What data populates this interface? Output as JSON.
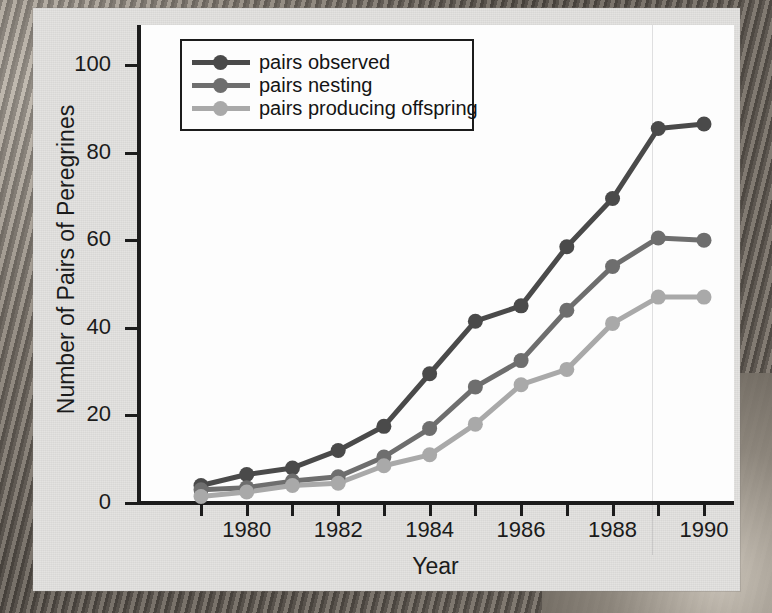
{
  "figure": {
    "background_color": "#e4e3e1",
    "plot_background_color": "#fdfdfd",
    "axis_color": "#1c1c1c"
  },
  "legend": {
    "position": "top-left-inside",
    "entries": [
      {
        "label": "pairs observed",
        "color": "#4a4a4a"
      },
      {
        "label": "pairs nesting",
        "color": "#6e6e6e"
      },
      {
        "label": "pairs producing offspring",
        "color": "#a9a9a9"
      }
    ]
  },
  "axes": {
    "y_title": "Number of Pairs of Peregrines",
    "x_title": "Year",
    "y_ticks": [
      "0",
      "20",
      "40",
      "60",
      "80",
      "100"
    ],
    "x_ticks_labeled": [
      "1980",
      "1982",
      "1984",
      "1986",
      "1988",
      "1990"
    ]
  },
  "chart_data": {
    "type": "line",
    "title": "",
    "subtitle": "",
    "xlabel": "Year",
    "ylabel": "Number of Pairs of Peregrines",
    "xlim": [
      1979,
      1990
    ],
    "ylim": [
      0,
      105
    ],
    "ytick_values": [
      0,
      20,
      40,
      60,
      80,
      100
    ],
    "xtick_values": [
      1979,
      1980,
      1981,
      1982,
      1983,
      1984,
      1985,
      1986,
      1987,
      1988,
      1989,
      1990
    ],
    "xtick_labels_shown": [
      1980,
      1982,
      1984,
      1986,
      1988,
      1990
    ],
    "grid": false,
    "legend_position": "upper left",
    "x": [
      1979,
      1980,
      1981,
      1982,
      1983,
      1984,
      1985,
      1986,
      1987,
      1988,
      1989,
      1990
    ],
    "series": [
      {
        "name": "pairs observed",
        "color": "#4a4a4a",
        "values": [
          4,
          6.5,
          8,
          12,
          17.5,
          29.5,
          41.5,
          45,
          58.5,
          69.5,
          85.5,
          86.5
        ]
      },
      {
        "name": "pairs nesting",
        "color": "#6e6e6e",
        "values": [
          3,
          3.5,
          5,
          6,
          10.5,
          17,
          26.5,
          32.5,
          44,
          54,
          60.5,
          60
        ]
      },
      {
        "name": "pairs producing offspring",
        "color": "#a9a9a9",
        "values": [
          1.5,
          2.5,
          4,
          4.5,
          8.5,
          11,
          18,
          27,
          30.5,
          41,
          47,
          47
        ]
      }
    ]
  }
}
